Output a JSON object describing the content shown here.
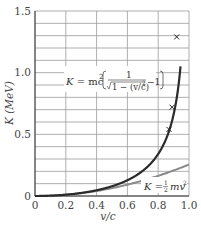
{
  "chart_data": {
    "type": "line",
    "title": "",
    "xlabel": "v/c",
    "ylabel": "K (MeV)",
    "xlim": [
      0,
      1.0
    ],
    "ylim": [
      0,
      1.5
    ],
    "x_ticks": [
      "0",
      "0.2",
      "0.4",
      "0.6",
      "0.8",
      "1.0"
    ],
    "y_ticks": [
      "0",
      "0.5",
      "1.0",
      "1.5"
    ],
    "grid": true,
    "grid_minor_y_step": 0.1,
    "grid_x_step": 0.2,
    "series": [
      {
        "name": "relativistic",
        "label": "K = mc² [ 1/√(1 − (v/c)²) − 1 ]",
        "color": "#2b2b2b",
        "x": [
          0,
          0.1,
          0.2,
          0.3,
          0.4,
          0.5,
          0.6,
          0.65,
          0.7,
          0.75,
          0.8,
          0.84,
          0.87,
          0.89,
          0.91,
          0.92,
          0.93,
          0.94
        ],
        "y": [
          0,
          0.003,
          0.01,
          0.025,
          0.047,
          0.079,
          0.128,
          0.161,
          0.205,
          0.262,
          0.341,
          0.431,
          0.525,
          0.61,
          0.721,
          0.793,
          0.88,
          0.987
        ]
      },
      {
        "name": "classical",
        "label": "K = ½ mv²",
        "color": "#8a8a8a",
        "x": [
          0,
          0.2,
          0.4,
          0.6,
          0.8,
          1.0
        ],
        "y": [
          0,
          0.01,
          0.041,
          0.092,
          0.164,
          0.256
        ]
      },
      {
        "name": "experimental points",
        "marker": "x",
        "color": "#2b2b2b",
        "x": [
          0.87,
          0.89,
          0.92
        ],
        "y": [
          0.54,
          0.72,
          1.29
        ]
      }
    ],
    "annotations": [
      {
        "text": "K = mc² [ 1/√(1 − (v/c)²) − 1 ]",
        "x": 0.45,
        "y": 0.92
      },
      {
        "text": "K = ½ mv²",
        "x": 0.9,
        "y": 0.07
      }
    ]
  },
  "labels": {
    "ylabel": "K (MeV)",
    "xlabel": "v/c",
    "rel_K": "K",
    "rel_eq": "= mc",
    "rel_sq": "2",
    "rel_num": "1",
    "rel_den": "1 − (v/c)",
    "rel_den_sq": "2",
    "rel_minus": "−1",
    "cls_K": "K",
    "cls_eq": "=",
    "cls_half_n": "1",
    "cls_half_d": "2",
    "cls_mv": "mv",
    "cls_sq": "2"
  }
}
